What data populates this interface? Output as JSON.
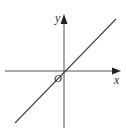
{
  "diagram": {
    "type": "coordinate-plane",
    "axes": {
      "x_label": "x",
      "y_label": "y",
      "origin_label": "O"
    },
    "line": {
      "description": "straight line through origin with positive slope",
      "slope": 1
    },
    "colors": {
      "axis": "#555555",
      "line": "#444444",
      "label": "#333333"
    }
  }
}
